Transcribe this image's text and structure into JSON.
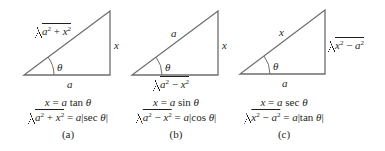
{
  "figures": [
    {
      "id": "a",
      "label": "(a)",
      "hypotenuse": {
        "radicand": [
          "a",
          "2",
          " + ",
          "x",
          "2"
        ]
      },
      "opposite": "x",
      "adjacent": "a",
      "angle": "θ",
      "substitution": {
        "lhs": "x",
        "eq": " = ",
        "coef": "a",
        "fn": " tan ",
        "var": "θ"
      },
      "identity": {
        "radicand": [
          "a",
          "2",
          " + ",
          "x",
          "2"
        ],
        "eq": " = ",
        "coef": "a",
        "abs_fn": "sec ",
        "var": "θ"
      }
    },
    {
      "id": "b",
      "label": "(b)",
      "hypotenuse": "a",
      "opposite": "x",
      "adjacent": {
        "radicand": [
          "a",
          "2",
          " − ",
          "x",
          "2"
        ]
      },
      "angle": "θ",
      "substitution": {
        "lhs": "x",
        "eq": " = ",
        "coef": "a",
        "fn": " sin ",
        "var": "θ"
      },
      "identity": {
        "radicand": [
          "a",
          "2",
          " − ",
          "x",
          "2"
        ],
        "eq": " = ",
        "coef": "a",
        "abs_fn": "cos ",
        "var": "θ"
      }
    },
    {
      "id": "c",
      "label": "(c)",
      "hypotenuse": "x",
      "opposite": {
        "radicand": [
          "x",
          "2",
          " − ",
          "a",
          "2"
        ]
      },
      "adjacent": "a",
      "angle": "θ",
      "substitution": {
        "lhs": "x",
        "eq": " = ",
        "coef": "a",
        "fn": " sec ",
        "var": "θ"
      },
      "identity": {
        "radicand": [
          "x",
          "2",
          " − ",
          "a",
          "2"
        ],
        "eq": " = ",
        "coef": "a",
        "abs_fn": "tan ",
        "var": "θ"
      }
    }
  ],
  "colors": {
    "line": "#6d6e71",
    "text": "#231f20",
    "background": "#ffffff"
  }
}
